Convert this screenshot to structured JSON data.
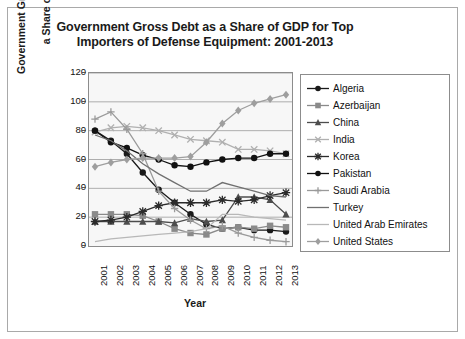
{
  "chart_data": {
    "type": "line",
    "title": "Government Gross Debt as a Share of GDP for Top Importers of Defense Equipment: 2001-2013",
    "title_line1": "Government Gross Debt as a Share of GDP for Top",
    "title_line2": "Importers of Defense Equipment: 2001-2013",
    "xlabel": "Year",
    "ylabel": "Government Gross Debt as a Share of GDP",
    "ylabel_line1": "Government Gross Debt as",
    "ylabel_line2": "a Share of GDP",
    "categories": [
      "2001",
      "2002",
      "2003",
      "2004",
      "2005",
      "2006",
      "2007",
      "2008",
      "2009",
      "2010",
      "2011",
      "2012",
      "2013"
    ],
    "x": [
      2001,
      2002,
      2003,
      2004,
      2005,
      2006,
      2007,
      2008,
      2009,
      2010,
      2011,
      2012,
      2013
    ],
    "ylim": [
      0,
      120
    ],
    "yticks": [
      0,
      20,
      40,
      60,
      80,
      100,
      120
    ],
    "grid": true,
    "legend_position": "right",
    "series": [
      {
        "name": "Algeria",
        "marker": "circle",
        "color": "#1a1a1a",
        "values": [
          80,
          73,
          64,
          51,
          39,
          30,
          22,
          15,
          12,
          13,
          11,
          11,
          10
        ]
      },
      {
        "name": "Azerbaijan",
        "marker": "square",
        "color": "#8a8a8a",
        "values": [
          22,
          22,
          22,
          21,
          17,
          12,
          9,
          8,
          12,
          13,
          12,
          14,
          13
        ]
      },
      {
        "name": "China",
        "marker": "triangle",
        "color": "#4d4d4d",
        "values": [
          17,
          17,
          17,
          17,
          17,
          16,
          19,
          17,
          18,
          34,
          34,
          32,
          22
        ]
      },
      {
        "name": "India",
        "marker": "x",
        "color": "#b0b0b0",
        "values": [
          79,
          82,
          83,
          82,
          80,
          77,
          74,
          73,
          72,
          67,
          67,
          66,
          64
        ]
      },
      {
        "name": "Korea",
        "marker": "star",
        "color": "#2b2b2b",
        "values": [
          17,
          18,
          20,
          24,
          28,
          30,
          30,
          30,
          32,
          31,
          32,
          35,
          37
        ]
      },
      {
        "name": "Pakistan",
        "marker": "circle-filled",
        "color": "#111111",
        "values": [
          80,
          72,
          68,
          63,
          60,
          56,
          55,
          58,
          60,
          61,
          61,
          64,
          64
        ]
      },
      {
        "name": "Saudi Arabia",
        "marker": "plus",
        "color": "#9a9a9a",
        "values": [
          88,
          93,
          81,
          64,
          38,
          26,
          18,
          12,
          14,
          9,
          6,
          4,
          3
        ]
      },
      {
        "name": "Turkey",
        "marker": "line",
        "color": "#707070",
        "values": [
          77,
          73,
          66,
          57,
          50,
          44,
          38,
          38,
          44,
          41,
          38,
          35,
          34
        ]
      },
      {
        "name": "United Arab Emirates",
        "marker": "line",
        "color": "#b8b8b8",
        "values": [
          3,
          5,
          6,
          7,
          8,
          9,
          10,
          12,
          22,
          22,
          20,
          19,
          18
        ]
      },
      {
        "name": "United States",
        "marker": "diamond",
        "color": "#9e9e9e",
        "values": [
          55,
          58,
          60,
          61,
          61,
          61,
          62,
          72,
          85,
          94,
          99,
          102,
          105
        ]
      }
    ]
  }
}
